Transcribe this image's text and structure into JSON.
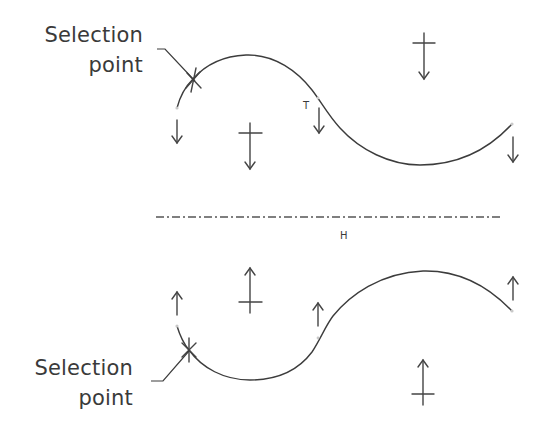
{
  "diagram": {
    "colors": {
      "stroke": "#3c3c3c",
      "text": "#3a3a3a",
      "background": "#ffffff"
    },
    "axis": {
      "label": "H",
      "style": "dash-dot"
    },
    "top": {
      "selection_label_line1": "Selection",
      "selection_label_line2": "point",
      "tangent_label": "T",
      "arrow_direction": "down"
    },
    "bottom": {
      "selection_label_line1": "Selection",
      "selection_label_line2": "point",
      "arrow_direction": "up"
    }
  }
}
